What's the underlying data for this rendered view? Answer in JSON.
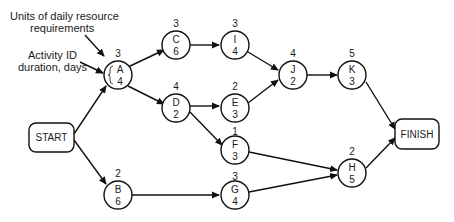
{
  "annotations": {
    "resource_label_line1": "Units of daily resource",
    "resource_label_line2": "requirements",
    "activity_label_line1": "Activity ID",
    "activity_label_line2": "duration, days"
  },
  "terminals": {
    "start": "START",
    "finish": "FINISH"
  },
  "activities": {
    "A": {
      "id": "A",
      "duration": "4",
      "resources": "3"
    },
    "B": {
      "id": "B",
      "duration": "6",
      "resources": "2"
    },
    "C": {
      "id": "C",
      "duration": "6",
      "resources": "3"
    },
    "D": {
      "id": "D",
      "duration": "2",
      "resources": "4"
    },
    "E": {
      "id": "E",
      "duration": "3",
      "resources": "2"
    },
    "F": {
      "id": "F",
      "duration": "3",
      "resources": "1"
    },
    "G": {
      "id": "G",
      "duration": "4",
      "resources": "3"
    },
    "H": {
      "id": "H",
      "duration": "5",
      "resources": "2"
    },
    "I": {
      "id": "I",
      "duration": "4",
      "resources": "3"
    },
    "J": {
      "id": "J",
      "duration": "2",
      "resources": "4"
    },
    "K": {
      "id": "K",
      "duration": "3",
      "resources": "5"
    }
  },
  "edges": [
    [
      "START",
      "A"
    ],
    [
      "START",
      "B"
    ],
    [
      "A",
      "C"
    ],
    [
      "A",
      "D"
    ],
    [
      "C",
      "I"
    ],
    [
      "D",
      "E"
    ],
    [
      "D",
      "F"
    ],
    [
      "I",
      "J"
    ],
    [
      "E",
      "J"
    ],
    [
      "J",
      "K"
    ],
    [
      "K",
      "FINISH"
    ],
    [
      "B",
      "G"
    ],
    [
      "F",
      "H"
    ],
    [
      "G",
      "H"
    ],
    [
      "H",
      "FINISH"
    ]
  ]
}
